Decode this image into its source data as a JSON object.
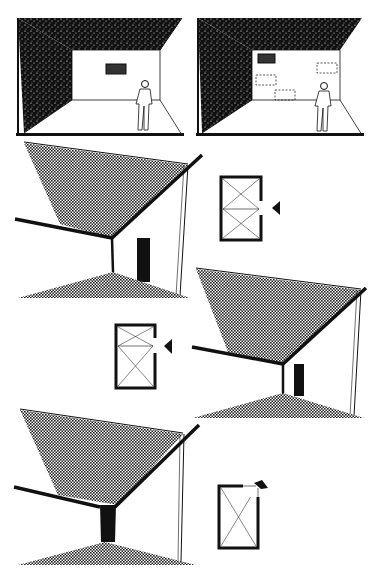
{
  "figure": {
    "type": "architectural-sketch",
    "background": "#ffffff",
    "ink": "#111111",
    "panels": [
      {
        "id": "room-before",
        "desc": "room with dark textured walls, single picture, standing figure"
      },
      {
        "id": "room-after",
        "desc": "room with dark textured walls, one picture and dashed outlines of frames, standing figure"
      },
      {
        "id": "corner-room-1",
        "desc": "perspective corner with hatched ceiling and floor, door on right wall"
      },
      {
        "id": "plan-1",
        "desc": "plan with arrow pointing from right"
      },
      {
        "id": "plan-2",
        "desc": "plan with arrow pointing from right"
      },
      {
        "id": "corner-room-2",
        "desc": "perspective corner with hatched ceiling and floor, door on right wall"
      },
      {
        "id": "corner-room-3",
        "desc": "perspective corner with hatched ceiling, dark column, floor"
      },
      {
        "id": "plan-3",
        "desc": "plan with arrow on top-right corner"
      }
    ]
  }
}
